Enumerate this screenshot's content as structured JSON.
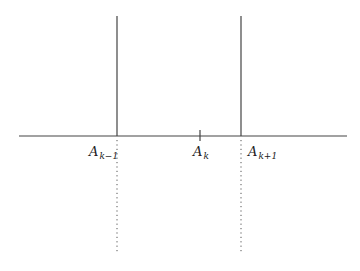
{
  "diagram": {
    "colors": {
      "line": "#444444",
      "dotted": "#555555",
      "label": "#222222"
    },
    "axis": {
      "y": 136,
      "x_start": 19,
      "x_end": 347
    },
    "points": [
      {
        "id": "a-k-minus-1",
        "base": "A",
        "subscript": "k−1",
        "x": 117,
        "solid_top": 16,
        "dotted_bottom": 254,
        "label_x": 89,
        "label_y": 145
      },
      {
        "id": "a-k",
        "base": "A",
        "subscript": "k",
        "x": 200,
        "tick_top": 130,
        "tick_bottom": 141,
        "label_x": 193,
        "label_y": 145
      },
      {
        "id": "a-k-plus-1",
        "base": "A",
        "subscript": "k+1",
        "x": 241,
        "solid_top": 16,
        "dotted_bottom": 254,
        "label_x": 248,
        "label_y": 145
      }
    ]
  }
}
